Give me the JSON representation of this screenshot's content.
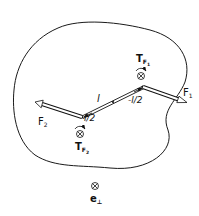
{
  "diagram": {
    "type": "mechanics-force-couple",
    "body_outline_color": "#1a1a1a",
    "labels": {
      "F1": "F",
      "F1_sub": "1",
      "F2": "F",
      "F2_sub": "2",
      "T_F1": "T",
      "T_F1_sub": "F",
      "T_F1_subsub": "1",
      "T_F2": "T",
      "T_F2_sub": "F",
      "T_F2_subsub": "2",
      "l": "l",
      "half_l": "l/2",
      "neg_half_l": "-l/2",
      "e_perp": "e",
      "e_perp_sub": "⊥",
      "cross_symbol": "⊗"
    },
    "icons": {
      "into_page": "circled-cross-icon",
      "rotation": "curved-arrow-icon"
    }
  }
}
